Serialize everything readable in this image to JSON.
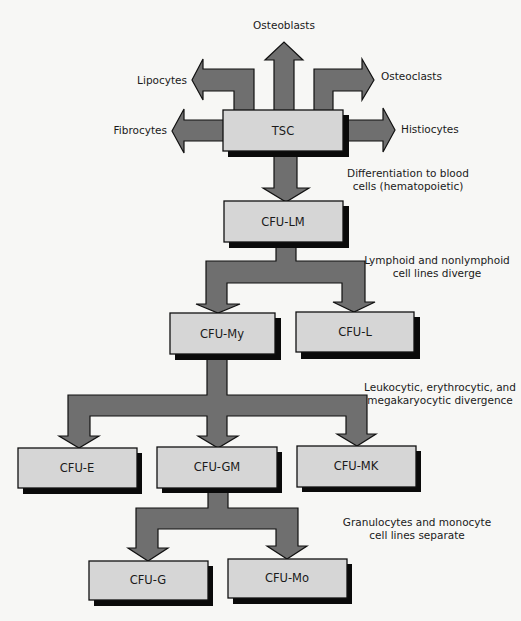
{
  "diagram": {
    "colors": {
      "arrow_fill": "#6f6f6f",
      "box_fill": "#d6d6d6",
      "shadow": "#0a0a0a",
      "background": "#f7f7f5"
    },
    "root": {
      "label": "TSC",
      "outputs": {
        "up": "Osteoblasts",
        "upper_left": "Lipocytes",
        "upper_right": "Osteoclasts",
        "left": "Fibrocytes",
        "right": "Histiocytes"
      }
    },
    "nodes": {
      "cfu_lm": "CFU-LM",
      "cfu_my": "CFU-My",
      "cfu_l": "CFU-L",
      "cfu_e": "CFU-E",
      "cfu_gm": "CFU-GM",
      "cfu_mk": "CFU-MK",
      "cfu_g": "CFU-G",
      "cfu_mo": "CFU-Mo"
    },
    "annotations": {
      "differentiation": [
        "Differentiation to blood",
        "cells (hematopoietic)"
      ],
      "lymphoid": [
        "Lymphoid and nonlymphoid",
        "cell lines diverge"
      ],
      "leukocytic": [
        "Leukocytic, erythrocytic, and",
        "megakaryocytic divergence"
      ],
      "granulocytes": [
        "Granulocytes and monocyte",
        "cell lines separate"
      ]
    },
    "edges": [
      {
        "from": "TSC",
        "to": "Osteoblasts"
      },
      {
        "from": "TSC",
        "to": "Lipocytes"
      },
      {
        "from": "TSC",
        "to": "Osteoclasts"
      },
      {
        "from": "TSC",
        "to": "Fibrocytes"
      },
      {
        "from": "TSC",
        "to": "Histiocytes"
      },
      {
        "from": "TSC",
        "to": "CFU-LM"
      },
      {
        "from": "CFU-LM",
        "to": "CFU-My"
      },
      {
        "from": "CFU-LM",
        "to": "CFU-L"
      },
      {
        "from": "CFU-My",
        "to": "CFU-E"
      },
      {
        "from": "CFU-My",
        "to": "CFU-GM"
      },
      {
        "from": "CFU-My",
        "to": "CFU-MK"
      },
      {
        "from": "CFU-GM",
        "to": "CFU-G"
      },
      {
        "from": "CFU-GM",
        "to": "CFU-Mo"
      }
    ]
  }
}
